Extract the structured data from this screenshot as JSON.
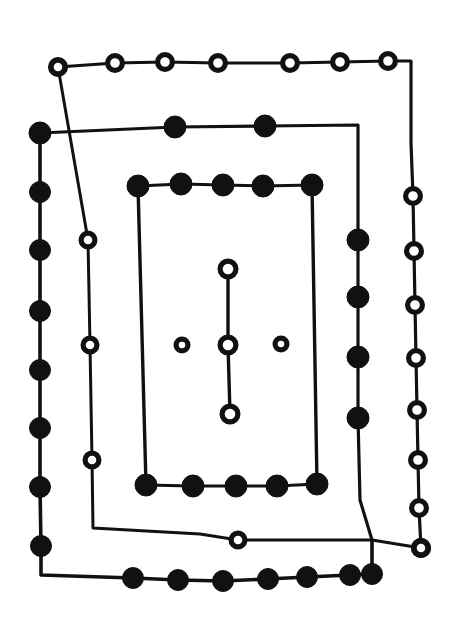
{
  "figure": {
    "background_color": "#ffffff",
    "stroke_color": "#111111",
    "filled_node_color": "#111111",
    "open_node_color": "#ffffff",
    "width": 459,
    "height": 641
  },
  "chart_data": {
    "type": "scatter",
    "title": "",
    "xlabel": "",
    "ylabel": "",
    "xlim": [
      0,
      459
    ],
    "ylim": [
      0,
      641
    ],
    "grid": false,
    "legend": "none",
    "annotations": [],
    "node_types": [
      "filled",
      "open"
    ],
    "series": [
      {
        "name": "outer-open-loop",
        "marker": "open-circle",
        "marker_radius": 10.5,
        "stroke_width": 3.2,
        "closed": false,
        "points": [
          [
            58,
            67
          ],
          [
            115,
            63
          ],
          [
            165,
            62
          ],
          [
            218,
            63
          ],
          [
            290,
            63
          ],
          [
            340,
            62
          ],
          [
            388,
            61
          ],
          [
            411,
            61
          ],
          [
            411,
            90
          ],
          [
            411,
            143
          ],
          [
            413,
            196
          ],
          [
            414,
            251
          ],
          [
            415,
            305
          ],
          [
            416,
            358
          ],
          [
            417,
            410
          ],
          [
            418,
            460
          ],
          [
            419,
            508
          ],
          [
            421,
            548
          ],
          [
            421,
            548
          ]
        ],
        "node_indices": [
          0,
          1,
          2,
          3,
          4,
          5,
          6,
          10,
          11,
          12,
          13,
          14,
          15,
          16,
          17,
          18
        ]
      },
      {
        "name": "outer-filled-loop",
        "marker": "filled-circle",
        "marker_radius": 10.5,
        "stroke_width": 3.6,
        "closed": false,
        "points": [
          [
            40,
            133
          ],
          [
            40,
            192
          ],
          [
            40,
            250
          ],
          [
            40,
            311
          ],
          [
            40,
            370
          ],
          [
            40,
            428
          ],
          [
            40,
            487
          ],
          [
            41,
            546
          ],
          [
            41,
            575
          ],
          [
            133,
            578
          ],
          [
            178,
            580
          ],
          [
            223,
            581
          ],
          [
            268,
            579
          ],
          [
            307,
            577
          ],
          [
            350,
            575
          ],
          [
            372,
            574
          ],
          [
            372,
            540
          ]
        ],
        "node_indices": [
          0,
          1,
          2,
          3,
          4,
          5,
          6,
          7,
          9,
          10,
          11,
          12,
          13,
          14,
          15
        ]
      },
      {
        "name": "middle-open-chain",
        "marker": "open-circle",
        "marker_radius": 10.0,
        "stroke_width": 3.0,
        "closed": false,
        "points": [
          [
            58,
            67
          ],
          [
            88,
            240
          ],
          [
            90,
            345
          ],
          [
            92,
            460
          ],
          [
            93,
            528
          ],
          [
            200,
            534
          ],
          [
            238,
            540
          ],
          [
            372,
            540
          ],
          [
            421,
            548
          ]
        ],
        "node_indices": [
          0,
          1,
          2,
          3,
          6,
          8
        ]
      },
      {
        "name": "middle-filled-rect",
        "marker": "filled-circle",
        "marker_radius": 11.0,
        "stroke_width": 3.2,
        "closed": false,
        "points": [
          [
            40,
            133
          ],
          [
            175,
            127
          ],
          [
            265,
            126
          ],
          [
            358,
            125
          ],
          [
            358,
            240
          ],
          [
            358,
            297
          ],
          [
            358,
            357
          ],
          [
            358,
            418
          ],
          [
            360,
            500
          ],
          [
            372,
            540
          ]
        ],
        "node_indices": [
          0,
          1,
          2,
          4,
          5,
          6,
          7
        ]
      },
      {
        "name": "inner-top-filled-row",
        "marker": "filled-circle",
        "marker_radius": 11.0,
        "stroke_width": 3.0,
        "closed": false,
        "points": [
          [
            138,
            186
          ],
          [
            181,
            184
          ],
          [
            223,
            185
          ],
          [
            263,
            186
          ],
          [
            312,
            185
          ]
        ],
        "node_indices": [
          0,
          1,
          2,
          3,
          4
        ]
      },
      {
        "name": "inner-bottom-filled-row",
        "marker": "filled-circle",
        "marker_radius": 11.0,
        "stroke_width": 3.0,
        "closed": false,
        "points": [
          [
            146,
            485
          ],
          [
            193,
            486
          ],
          [
            236,
            486
          ],
          [
            277,
            486
          ],
          [
            317,
            484
          ]
        ],
        "node_indices": [
          0,
          1,
          2,
          3,
          4
        ]
      },
      {
        "name": "inner-left-stem",
        "marker": "none",
        "stroke_width": 3.4,
        "closed": false,
        "points": [
          [
            138,
            186
          ],
          [
            146,
            485
          ]
        ],
        "node_indices": []
      },
      {
        "name": "inner-right-stem",
        "marker": "none",
        "stroke_width": 3.4,
        "closed": false,
        "points": [
          [
            312,
            185
          ],
          [
            317,
            484
          ]
        ],
        "node_indices": []
      },
      {
        "name": "center-open-chain",
        "marker": "open-circle",
        "marker_radius": 11.0,
        "stroke_width": 3.4,
        "closed": false,
        "points": [
          [
            228,
            269
          ],
          [
            228,
            345
          ],
          [
            230,
            414
          ]
        ],
        "node_indices": [
          0,
          1,
          2
        ]
      },
      {
        "name": "center-left-open-node",
        "marker": "open-circle",
        "marker_radius": 9.0,
        "stroke_width": 0,
        "closed": false,
        "points": [
          [
            182,
            345
          ]
        ],
        "node_indices": [
          0
        ]
      },
      {
        "name": "center-right-open-node",
        "marker": "open-circle",
        "marker_radius": 9.0,
        "stroke_width": 0,
        "closed": false,
        "points": [
          [
            281,
            344
          ]
        ],
        "node_indices": [
          0
        ]
      }
    ],
    "counts": {
      "filled_nodes": 34,
      "open_nodes": 27,
      "total_nodes": 61
    }
  }
}
